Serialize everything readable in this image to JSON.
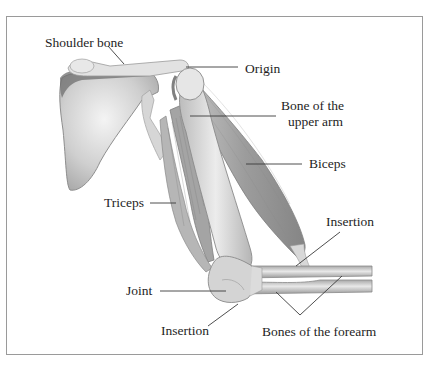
{
  "diagram": {
    "labels": {
      "shoulder_bone": "Shoulder bone",
      "origin": "Origin",
      "bone_upper_arm_line1": "Bone of the",
      "bone_upper_arm_line2": "upper arm",
      "biceps": "Biceps",
      "triceps": "Triceps",
      "insertion_biceps": "Insertion",
      "joint": "Joint",
      "insertion_triceps": "Insertion",
      "bones_forearm": "Bones of the forearm"
    },
    "colors": {
      "bone": "#dcdcdc",
      "bone_shade": "#bdbdbd",
      "bone_dark": "#7a7a7a",
      "muscle": "#a9a9a9",
      "muscle_dark": "#8c8c8c",
      "line": "#3a3a3a",
      "frame": "#9a9a9a"
    }
  }
}
